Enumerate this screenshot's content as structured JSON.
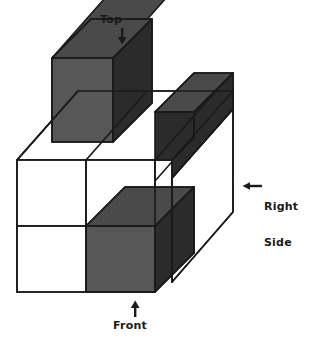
{
  "figure": {
    "kind": "isometric-cube-stack-diagram",
    "background_color": "#ffffff",
    "stroke_color": "#1a1a1a",
    "face_colors": {
      "white_face": "#ffffff",
      "top_shaded": "#4a4a4a",
      "front_shaded": "#575757",
      "side_shaded": "#2b2b2b"
    },
    "labels": {
      "top": {
        "text": "Top",
        "arrow_icon": "arrow-down-icon",
        "arrow_direction": "down"
      },
      "front": {
        "text": "Front",
        "arrow_icon": "arrow-up-icon",
        "arrow_direction": "up"
      },
      "right_side": {
        "line1": "Right",
        "line2": "Side",
        "arrow_icon": "arrow-left-icon",
        "arrow_direction": "left"
      }
    },
    "cubes": [
      {
        "id": "back-top-left",
        "shaded": true,
        "note": "upper-left dark cube"
      },
      {
        "id": "back-top-right",
        "shaded": true,
        "note": "upper-right dark cube"
      },
      {
        "id": "front-low-left",
        "shaded": false,
        "note": "white column, two cubes tall"
      },
      {
        "id": "front-low-mid",
        "shaded": true,
        "note": "front bottom dark cube"
      },
      {
        "id": "back-low-right",
        "shaded": false,
        "note": "white right slab"
      }
    ]
  }
}
